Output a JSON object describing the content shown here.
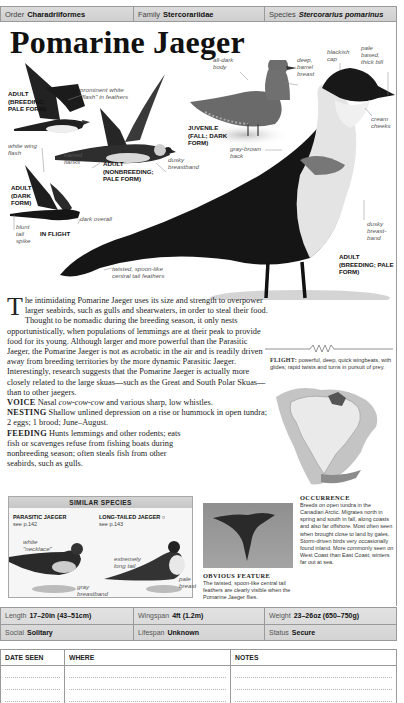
{
  "taxonomy": {
    "order": {
      "label": "Order",
      "value": "Charadriiformes"
    },
    "family": {
      "label": "Family",
      "value": "Stercorariidae"
    },
    "species": {
      "label": "Species",
      "value": "Stercorarius pomarinus"
    }
  },
  "title": "Pomarine Jaeger",
  "illustration": {
    "labels": {
      "prominent_flash": "prominent white \"flash\" in feathers",
      "white_wing_flash": "white wing flash",
      "barred_flanks": "barred flanks",
      "dusky_breastband_1": "dusky breastband",
      "dark_overall": "dark overall",
      "blunt_tail_spike": "blunt tail spike",
      "twisted_tail": "twisted, spoon-like central tail feathers",
      "all_dark_body": "all-dark body",
      "deep_barrel_breast": "deep, barrel breast",
      "blackish_cap": "blackish cap",
      "pale_based_bill": "pale based, thick bill",
      "cream_cheeks": "cream cheeks",
      "gray_brown_back": "gray-brown back",
      "dusky_breastband_2": "dusky breast-band"
    },
    "captions": {
      "adult_breeding_pale_flight": "ADULT (BREEDING; PALE FORM)",
      "adult_nonbreeding_pale": "ADULT (NONBREEDING; PALE FORM)",
      "adult_dark": "ADULT (DARK FORM)",
      "in_flight": "IN FLIGHT",
      "juvenile": "JUVENILE (FALL; DARK FORM)",
      "adult_breeding_pale_main": "ADULT (BREEDING; PALE FORM)"
    }
  },
  "body": {
    "dropcap": "T",
    "intro": "he intimidating Pomarine Jaeger uses its size and strength to overpower larger seabirds, such as gulls and shearwaters, in order to steal their food. Thought to be nomadic during the breeding season, it only nests opportunistically, when populations of lemmings are at their peak to provide food for its young. Although larger and more powerful than the Parasitic Jaeger, the Pomarine Jaeger is not as acrobatic in the air and is readily driven away from breeding territories by the more dynamic Parasitic Jaeger. Interestingly, research suggests that the Pomarine Jaeger is actually more closely related to the large skuas—such as the Great and South Polar Skuas—than to other jaegers.",
    "voice_label": "VOICE",
    "voice_pre": "Nasal ",
    "voice_call": "cow-cow-cow",
    "voice_post": " and various sharp, low whistles.",
    "nesting_label": "NESTING",
    "nesting": "Shallow unlined depression on a rise or hummock in open tundra; 2 eggs; 1 brood; June–August.",
    "feeding_label": "FEEDING",
    "feeding": "Hunts lemmings and other rodents; eats fish or scavenges refuse from fishing boats during nonbreeding season; often steals fish from other seabirds, such as gulls."
  },
  "flight": {
    "label": "FLIGHT:",
    "text": "powerful, deep, quick wingbeats, with glides; rapid twists and turns in pursuit of prey."
  },
  "similar_species": {
    "heading": "SIMILAR SPECIES",
    "items": [
      {
        "name": "PARASITIC JAEGER",
        "page": "see p.142",
        "labels": [
          "white \"necklace\"",
          "gray breastband"
        ]
      },
      {
        "name": "LONG-TAILED JAEGER",
        "symbol": "○",
        "page": "see p.143",
        "labels": [
          "extremely long tail",
          "pale breast"
        ]
      }
    ]
  },
  "obvious_feature": {
    "title": "OBVIOUS FEATURE",
    "text": "The twisted, spoon-like central tail feathers are clearly visible when the Pomarine Jaeger flies."
  },
  "occurrence": {
    "title": "OCCURRENCE",
    "text": "Breeds on open tundra in the Canadian Arctic. Migrates north in spring and south in fall, along coasts and also far offshore. Most often seen when brought close to land by gales. Storm-driven birds very occasionally found inland. More commonly seen on West Coast than East Coast; winters far out at sea."
  },
  "stats": {
    "length": {
      "label": "Length",
      "value": "17–20in (43–51cm)"
    },
    "wingspan": {
      "label": "Wingspan",
      "value": "4ft (1.2m)"
    },
    "weight": {
      "label": "Weight",
      "value": "23–26oz (650–750g)"
    },
    "social": {
      "label": "Social",
      "value": "Solitary"
    },
    "lifespan": {
      "label": "Lifespan",
      "value": "Unknown"
    },
    "status": {
      "label": "Status",
      "value": "Secure"
    }
  },
  "log": {
    "columns": [
      "DATE SEEN",
      "WHERE",
      "NOTES"
    ]
  },
  "colors": {
    "header_gray": "#d4d4d4",
    "border_gray": "#9a9a9a",
    "map_range": "#b8b8b8"
  }
}
